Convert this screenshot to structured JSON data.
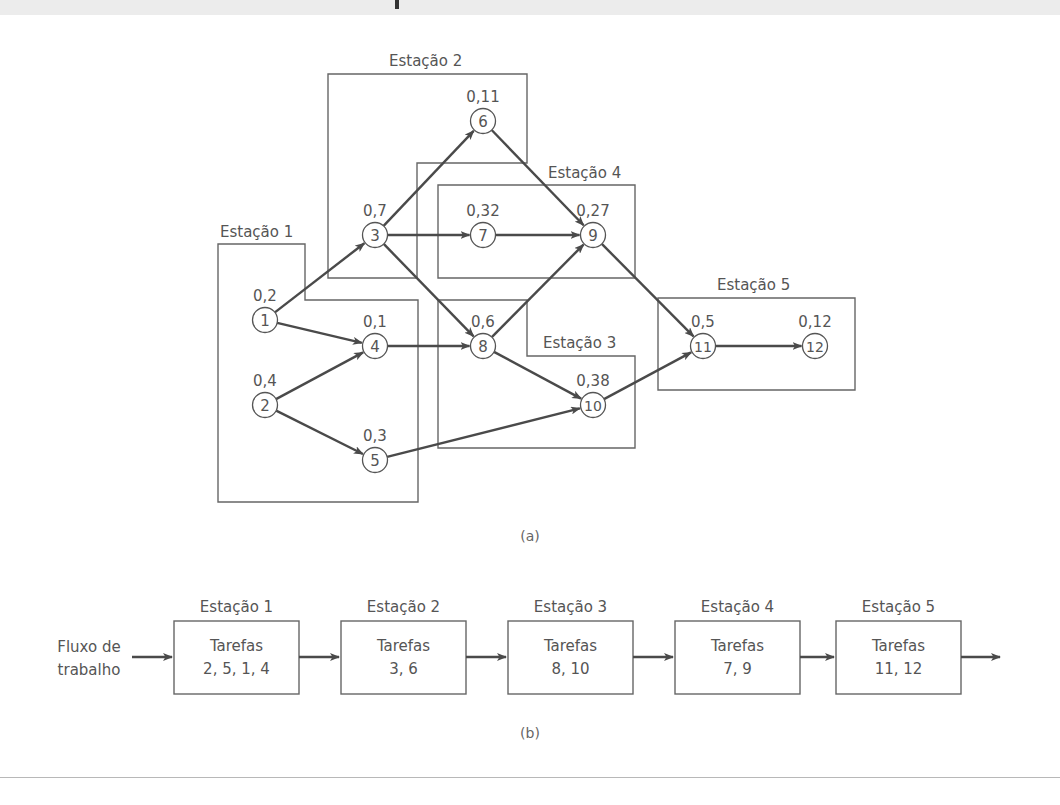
{
  "figure": {
    "part_a": {
      "caption": "(a)",
      "stations": [
        {
          "id": 1,
          "label": "Estação 1",
          "label_pos": [
            220,
            237
          ],
          "points": "218,244 305,244 305,300 418,300 418,502 218,502"
        },
        {
          "id": 2,
          "label": "Estação 2",
          "label_pos": [
            389,
            66
          ],
          "points": "328,74 527,74 527,163 417,163 417,278 328,278"
        },
        {
          "id": 3,
          "label": "Estação 3",
          "label_pos": [
            543,
            348
          ],
          "points": "438,300 527,300 527,356 635,356 635,448 438,448"
        },
        {
          "id": 4,
          "label": "Estação 4",
          "label_pos": [
            548,
            178
          ],
          "points": "438,185 635,185 635,278 438,278"
        },
        {
          "id": 5,
          "label": "Estação 5",
          "label_pos": [
            717,
            290
          ],
          "points": "658,298 855,298 855,390 658,390"
        }
      ],
      "nodes": [
        {
          "id": "1",
          "time": "0,2",
          "x": 265,
          "y": 320
        },
        {
          "id": "2",
          "time": "0,4",
          "x": 265,
          "y": 405
        },
        {
          "id": "3",
          "time": "0,7",
          "x": 375,
          "y": 235
        },
        {
          "id": "4",
          "time": "0,1",
          "x": 375,
          "y": 346
        },
        {
          "id": "5",
          "time": "0,3",
          "x": 375,
          "y": 460
        },
        {
          "id": "6",
          "time": "0,11",
          "x": 483,
          "y": 121
        },
        {
          "id": "7",
          "time": "0,32",
          "x": 483,
          "y": 235
        },
        {
          "id": "8",
          "time": "0,6",
          "x": 483,
          "y": 346
        },
        {
          "id": "9",
          "time": "0,27",
          "x": 593,
          "y": 235
        },
        {
          "id": "10",
          "time": "0,38",
          "x": 593,
          "y": 405
        },
        {
          "id": "11",
          "time": "0,5",
          "x": 703,
          "y": 346
        },
        {
          "id": "12",
          "time": "0,12",
          "x": 815,
          "y": 346
        }
      ],
      "edges": [
        [
          "1",
          "3"
        ],
        [
          "1",
          "4"
        ],
        [
          "2",
          "4"
        ],
        [
          "2",
          "5"
        ],
        [
          "3",
          "6"
        ],
        [
          "3",
          "7"
        ],
        [
          "3",
          "8"
        ],
        [
          "4",
          "8"
        ],
        [
          "6",
          "9"
        ],
        [
          "7",
          "9"
        ],
        [
          "8",
          "9"
        ],
        [
          "8",
          "10"
        ],
        [
          "5",
          "10"
        ],
        [
          "9",
          "11"
        ],
        [
          "10",
          "11"
        ],
        [
          "11",
          "12"
        ]
      ]
    },
    "part_b": {
      "caption": "(b)",
      "input_label_line1": "Fluxo de",
      "input_label_line2": "trabalho",
      "stations": [
        {
          "label": "Estação 1",
          "tasks_title": "Tarefas",
          "tasks": "2, 5, 1, 4",
          "x": 174
        },
        {
          "label": "Estação 2",
          "tasks_title": "Tarefas",
          "tasks": "3, 6",
          "x": 341
        },
        {
          "label": "Estação 3",
          "tasks_title": "Tarefas",
          "tasks": "8, 10",
          "x": 508
        },
        {
          "label": "Estação 4",
          "tasks_title": "Tarefas",
          "tasks": "7, 9",
          "x": 675
        },
        {
          "label": "Estação 5",
          "tasks_title": "Tarefas",
          "tasks": "11, 12",
          "x": 836
        }
      ]
    }
  },
  "colors": {
    "line": "#4a4a4a",
    "outline": "#666666",
    "text": "#555555"
  }
}
